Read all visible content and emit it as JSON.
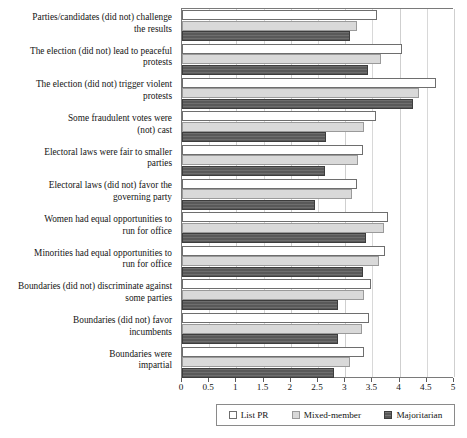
{
  "chart_data": {
    "type": "bar",
    "orientation": "horizontal",
    "title": "",
    "xlabel": "",
    "ylabel": "",
    "xlim": [
      0,
      5
    ],
    "xticks": [
      "0",
      "0.5",
      "1",
      "1.5",
      "2",
      "2.5",
      "3",
      "3.5",
      "4",
      "4.5",
      "5"
    ],
    "xtick_values": [
      0,
      0.5,
      1,
      1.5,
      2,
      2.5,
      3,
      3.5,
      4,
      4.5,
      5
    ],
    "grid": true,
    "legend_position": "bottom",
    "categories": [
      "Parties/candidates (did not) challenge the results",
      "The election (did not) lead to peaceful protests",
      "The election (did not) trigger violent protests",
      "Some fraudulent votes were (not) cast",
      "Electoral laws were fair to smaller parties",
      "Electoral laws (did not) favor the governing party",
      "Women had equal opportunities to run for office",
      "Minorities had equal opportunities to run for office",
      "Boundaries (did not) discriminate against some parties",
      "Boundaries (did not) favor incumbents",
      "Boundaries were impartial"
    ],
    "category_lines": [
      [
        "Parties/candidates (did not) challenge",
        "the results"
      ],
      [
        "The election (did not) lead to peaceful",
        "protests"
      ],
      [
        "The election (did not) trigger violent",
        "protests"
      ],
      [
        "Some fraudulent votes were",
        "(not) cast"
      ],
      [
        "Electoral laws were fair to smaller",
        "parties"
      ],
      [
        "Electoral laws (did not) favor the",
        "governing party"
      ],
      [
        "Women had equal opportunities to",
        "run for office"
      ],
      [
        "Minorities had equal opportunities to",
        "run for office"
      ],
      [
        "Boundaries (did not) discriminate against",
        "some parties"
      ],
      [
        "Boundaries (did not) favor",
        "incumbents"
      ],
      [
        "Boundaries were",
        "impartial"
      ]
    ],
    "series": [
      {
        "name": "List PR",
        "color": "#ffffff",
        "values": [
          3.58,
          4.05,
          4.66,
          3.57,
          3.32,
          3.22,
          3.79,
          3.73,
          3.48,
          3.44,
          3.34
        ]
      },
      {
        "name": "Mixed-member",
        "color": "#d9d9d9",
        "values": [
          3.21,
          3.65,
          4.35,
          3.35,
          3.24,
          3.12,
          3.72,
          3.63,
          3.35,
          3.3,
          3.09
        ]
      },
      {
        "name": "Majoritarian",
        "color": "#595959",
        "values": [
          3.08,
          3.42,
          4.25,
          2.64,
          2.63,
          2.45,
          3.38,
          3.33,
          2.86,
          2.87,
          2.79
        ]
      }
    ]
  },
  "legend": {
    "items": [
      {
        "label": "List PR",
        "swatch": "listpr"
      },
      {
        "label": "Mixed-member",
        "swatch": "mixed"
      },
      {
        "label": "Majoritarian",
        "swatch": "major"
      }
    ]
  }
}
